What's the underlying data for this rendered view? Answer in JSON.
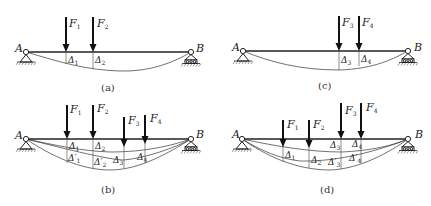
{
  "figure": {
    "panels": [
      {
        "id": "a",
        "caption": "(a)",
        "support_left": "A",
        "support_right": "B",
        "forces": [
          {
            "label": "F",
            "sub": "1",
            "x": 66
          },
          {
            "label": "F",
            "sub": "2",
            "x": 93
          }
        ],
        "deflections": [
          {
            "label": "Δ",
            "sub": "1"
          },
          {
            "label": "Δ",
            "sub": "2"
          }
        ]
      },
      {
        "id": "c",
        "caption": "(c)",
        "support_left": "A",
        "support_right": "B",
        "forces": [
          {
            "label": "F",
            "sub": "3"
          },
          {
            "label": "F",
            "sub": "4"
          }
        ],
        "deflections": [
          {
            "label": "Δ",
            "sub": "3"
          },
          {
            "label": "Δ",
            "sub": "4"
          }
        ]
      },
      {
        "id": "b",
        "caption": "(b)",
        "support_left": "A",
        "support_right": "B",
        "forces": [
          {
            "label": "F",
            "sub": "1"
          },
          {
            "label": "F",
            "sub": "2"
          },
          {
            "label": "F",
            "sub": "3"
          },
          {
            "label": "F",
            "sub": "4"
          }
        ],
        "deflections": [
          {
            "label": "Δ",
            "sub": "1"
          },
          {
            "label": "Δ",
            "sub": "2"
          },
          {
            "label": "Δ′",
            "sub": "1"
          },
          {
            "label": "Δ′",
            "sub": "2"
          },
          {
            "label": "Δ",
            "sub": "3"
          },
          {
            "label": "Δ",
            "sub": "4"
          }
        ]
      },
      {
        "id": "d",
        "caption": "(d)",
        "support_left": "A",
        "support_right": "B",
        "forces": [
          {
            "label": "F",
            "sub": "1"
          },
          {
            "label": "F",
            "sub": "2"
          },
          {
            "label": "F",
            "sub": "3"
          },
          {
            "label": "F",
            "sub": "4"
          }
        ],
        "deflections": [
          {
            "label": "Δ",
            "sub": "3"
          },
          {
            "label": "Δ",
            "sub": "4"
          },
          {
            "label": "Δ",
            "sub": "1"
          },
          {
            "label": "Δ",
            "sub": "2"
          },
          {
            "label": "Δ′",
            "sub": "3"
          },
          {
            "label": "Δ′",
            "sub": "4"
          }
        ]
      }
    ]
  }
}
